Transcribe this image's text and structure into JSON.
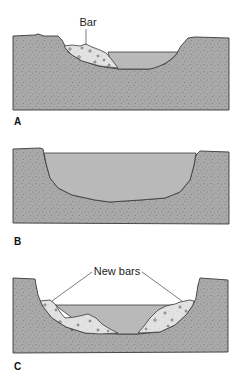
{
  "figure": {
    "panels": [
      {
        "id": "A",
        "label": "A",
        "callout": "Bar",
        "description": "Channel with a single point bar on the left bank"
      },
      {
        "id": "B",
        "label": "B",
        "callout": "",
        "description": "Widened channel with bar eroded away"
      },
      {
        "id": "C",
        "label": "C",
        "callout": "New bars",
        "description": "Widened channel with new bars deposited on both banks"
      }
    ],
    "colors": {
      "sediment": "#a9a9a9",
      "sediment_speckle": "#555555",
      "water": "#b9b9b9",
      "bar": "#e2e2e2",
      "outline": "#3a3a3a"
    }
  }
}
